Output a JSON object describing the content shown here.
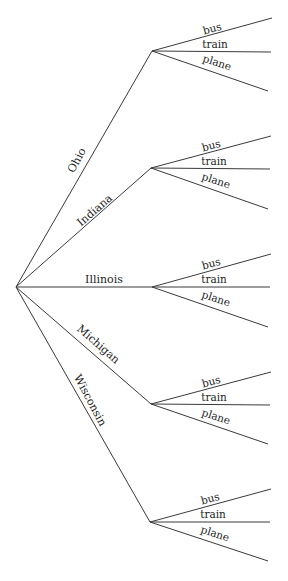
{
  "diagram": {
    "type": "tree",
    "root": {
      "x": 16,
      "y": 287
    },
    "colors": {
      "line": "#3a3a3a",
      "text": "#222222",
      "background": "#ffffff"
    },
    "states": [
      {
        "label": "Ohio",
        "node": {
          "x": 152,
          "y": 51
        },
        "label_pos": {
          "x": 80,
          "y": 162,
          "rot": -62
        },
        "modes": [
          {
            "label": "bus",
            "end": {
              "x": 272,
              "y": 18
            }
          },
          {
            "label": "train",
            "end": {
              "x": 271,
              "y": 52
            }
          },
          {
            "label": "plane",
            "end": {
              "x": 268,
              "y": 91
            }
          }
        ]
      },
      {
        "label": "Indiana",
        "node": {
          "x": 151,
          "y": 168
        },
        "label_pos": {
          "x": 97,
          "y": 213,
          "rot": -41
        },
        "modes": [
          {
            "label": "bus",
            "end": {
              "x": 271,
              "y": 136
            }
          },
          {
            "label": "train",
            "end": {
              "x": 270,
              "y": 169
            }
          },
          {
            "label": "plane",
            "end": {
              "x": 268,
              "y": 209
            }
          }
        ]
      },
      {
        "label": "Illinois",
        "node": {
          "x": 152,
          "y": 287
        },
        "label_pos": {
          "x": 104,
          "y": 283,
          "rot": 0
        },
        "modes": [
          {
            "label": "bus",
            "end": {
              "x": 271,
              "y": 254
            }
          },
          {
            "label": "train",
            "end": {
              "x": 270,
              "y": 287
            }
          },
          {
            "label": "plane",
            "end": {
              "x": 268,
              "y": 327
            }
          }
        ]
      },
      {
        "label": "Michigan",
        "node": {
          "x": 151,
          "y": 404
        },
        "label_pos": {
          "x": 96,
          "y": 347,
          "rot": 41
        },
        "modes": [
          {
            "label": "bus",
            "end": {
              "x": 271,
              "y": 372
            }
          },
          {
            "label": "train",
            "end": {
              "x": 270,
              "y": 405
            }
          },
          {
            "label": "plane",
            "end": {
              "x": 268,
              "y": 444
            }
          }
        ]
      },
      {
        "label": "Wisconsin",
        "node": {
          "x": 150,
          "y": 522
        },
        "label_pos": {
          "x": 87,
          "y": 402,
          "rot": 62
        },
        "modes": [
          {
            "label": "bus",
            "end": {
              "x": 271,
              "y": 489
            }
          },
          {
            "label": "train",
            "end": {
              "x": 270,
              "y": 522
            }
          },
          {
            "label": "plane",
            "end": {
              "x": 268,
              "y": 561
            }
          }
        ]
      }
    ]
  }
}
